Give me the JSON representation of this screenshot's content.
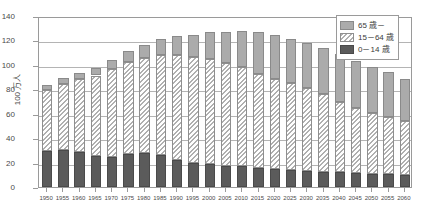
{
  "chart_data": {
    "type": "bar",
    "stacked": true,
    "title": "",
    "xlabel": "",
    "ylabel": "100 万人",
    "ylim": [
      0,
      140
    ],
    "ytick_step": 20,
    "yticks": [
      "140",
      "120",
      "100",
      "80",
      "60",
      "40",
      "20",
      "0"
    ],
    "grid": true,
    "legend_position": "top-right",
    "categories": [
      "1950",
      "1955",
      "1960",
      "1965",
      "1970",
      "1975",
      "1980",
      "1985",
      "1990",
      "1995",
      "2000",
      "2005",
      "2010",
      "2015",
      "2020",
      "2025",
      "2030",
      "2035",
      "2040",
      "2045",
      "2050",
      "2055",
      "2060"
    ],
    "series": [
      {
        "name": "0－14 歳",
        "key": "young",
        "color": "#5b5b5b",
        "pattern": "solid-dark",
        "values": [
          29.4,
          30.0,
          28.4,
          25.2,
          24.8,
          27.2,
          27.5,
          26.0,
          22.5,
          20.0,
          18.5,
          17.6,
          16.8,
          15.9,
          15.1,
          14.1,
          13.2,
          12.5,
          11.9,
          11.4,
          10.8,
          10.3,
          9.8
        ]
      },
      {
        "name": "15－64 歳",
        "key": "working",
        "color": "#ffffff",
        "pattern": "diagonal-hatch",
        "values": [
          49.7,
          54.7,
          59.9,
          66.1,
          71.6,
          75.0,
          78.2,
          82.4,
          85.9,
          86.5,
          86.2,
          84.0,
          81.1,
          76.8,
          73.4,
          70.8,
          67.7,
          63.4,
          57.9,
          53.5,
          50.0,
          47.1,
          44.2
        ]
      },
      {
        "name": "65 歳－",
        "key": "elderly",
        "color": "#ababab",
        "pattern": "solid-gray",
        "values": [
          4.1,
          4.8,
          5.4,
          6.2,
          7.3,
          8.9,
          10.6,
          12.5,
          14.9,
          18.3,
          22.0,
          25.7,
          29.5,
          33.9,
          36.1,
          36.6,
          36.9,
          37.8,
          38.7,
          38.5,
          37.7,
          36.6,
          34.6
        ]
      }
    ],
    "totals": [
      83.2,
      89.5,
      93.7,
      97.5,
      103.7,
      111.1,
      116.3,
      120.9,
      123.3,
      124.8,
      126.7,
      127.3,
      127.4,
      126.6,
      124.6,
      121.5,
      117.8,
      113.7,
      108.5,
      103.4,
      98.5,
      94.0,
      88.6
    ]
  },
  "legend": {
    "items": [
      {
        "label": "65 歳－",
        "swatch": "elderly-swatch"
      },
      {
        "label": "15－64 歳",
        "swatch": "working-swatch"
      },
      {
        "label": "0－14 歳",
        "swatch": "young-swatch"
      }
    ]
  },
  "axis": {
    "y_title": "100 万人"
  }
}
